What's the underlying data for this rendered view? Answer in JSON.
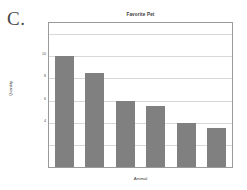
{
  "panel": {
    "letter": "C."
  },
  "chart_data": {
    "type": "bar",
    "title": "Favorite Pet",
    "xlabel": "Animal",
    "ylabel": "Quantity",
    "categories": [
      "",
      "",
      "",
      "",
      "",
      ""
    ],
    "values": [
      10,
      8.5,
      6,
      5.5,
      4,
      3.5
    ],
    "ylim": [
      0,
      13
    ],
    "yticks": [
      4,
      6,
      8,
      10
    ],
    "ytick_labels": [
      "4",
      "6",
      "8",
      "10"
    ],
    "gridlines": [
      2,
      4,
      6,
      8,
      10,
      12
    ],
    "grid": true,
    "legend": null,
    "bar_color": "#808080",
    "frame_color": "#9a9a9a",
    "grid_color": "#d8d8d8",
    "background": "#ffffff"
  }
}
